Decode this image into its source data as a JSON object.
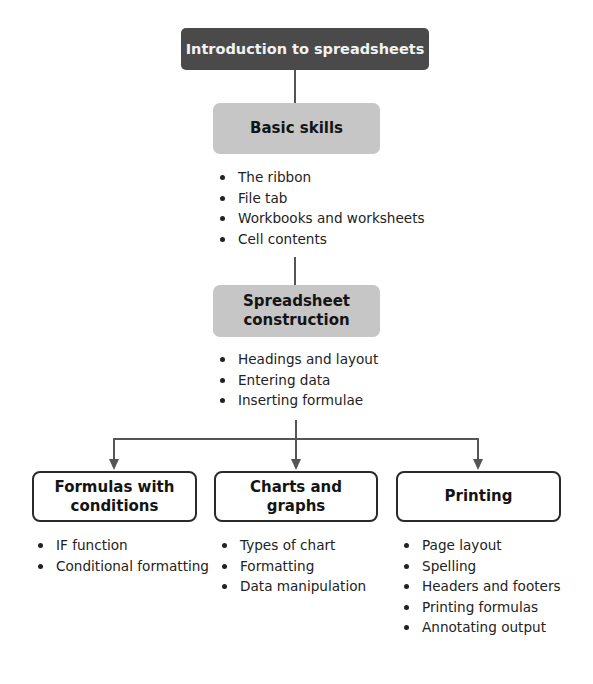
{
  "diagram": {
    "root": {
      "label": "Introduction to spreadsheets",
      "fill": "#4a4a4a"
    },
    "level1": {
      "label": "Basic skills",
      "fill": "#c6c6c6",
      "items": [
        "The ribbon",
        "File tab",
        "Workbooks and worksheets",
        "Cell contents"
      ]
    },
    "level2": {
      "label_line1": "Spreadsheet",
      "label_line2": "construction",
      "fill": "#c6c6c6",
      "items": [
        "Headings and layout",
        "Entering data",
        "Inserting formulae"
      ]
    },
    "branches": [
      {
        "label_line1": "Formulas with",
        "label_line2": "conditions",
        "items": [
          "IF function",
          "Conditional formatting"
        ]
      },
      {
        "label_line1": "Charts and",
        "label_line2": "graphs",
        "items": [
          "Types of chart",
          "Formatting",
          "Data manipulation"
        ]
      },
      {
        "label_line1": "Printing",
        "label_line2": "",
        "items": [
          "Page layout",
          "Spelling",
          "Headers and footers",
          "Printing formulas",
          "Annotating output"
        ]
      }
    ],
    "connector_color": "#555555"
  }
}
